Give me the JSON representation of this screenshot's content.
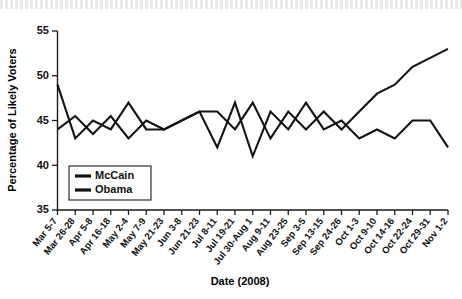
{
  "chart_data": {
    "type": "line",
    "title": "",
    "xlabel": "Date (2008)",
    "ylabel": "Percentage of Likely Voters",
    "ylim": [
      35,
      55
    ],
    "yticks": [
      35,
      40,
      45,
      50,
      55
    ],
    "grid": false,
    "legend_position": "bottom-left",
    "categories": [
      "Mar 5-7",
      "Mar 26-28",
      "Apr 5-8",
      "Apr 16-18",
      "May 2-4",
      "May 7-9",
      "May 21-23",
      "Jun 3-8",
      "Jun 21-23",
      "Jul 8-11",
      "Jul 19-21",
      "Jul 30-Aug 1",
      "Aug 9-11",
      "Aug 23-25",
      "Sep 3-5",
      "Sep 13-15",
      "Sep 24-26",
      "Oct 1-3",
      "Oct 9-10",
      "Oct 14-16",
      "Oct 22-24",
      "Oct 29-31",
      "Nov 1-2"
    ],
    "series": [
      {
        "name": "McCain",
        "values": [
          49,
          43,
          45,
          44,
          47,
          44,
          44,
          45,
          46,
          42,
          47,
          41,
          46,
          44,
          47,
          44,
          45,
          43,
          44,
          43,
          45,
          45,
          42
        ]
      },
      {
        "name": "Obama",
        "values": [
          44,
          45.5,
          43.5,
          45.5,
          43,
          45,
          44,
          45,
          46,
          46,
          44,
          47,
          43,
          46,
          44,
          46,
          44,
          46,
          48,
          49,
          51,
          52,
          53
        ]
      }
    ]
  },
  "legend": {
    "items": [
      {
        "label": "McCain",
        "color": "#121212"
      },
      {
        "label": "Obama",
        "color": "#121212"
      }
    ]
  },
  "axes": {
    "y_title": "Percentage of Likely Voters",
    "x_title": "Date (2008)",
    "y_tick_labels": [
      "55",
      "50",
      "45",
      "40",
      "35"
    ]
  }
}
